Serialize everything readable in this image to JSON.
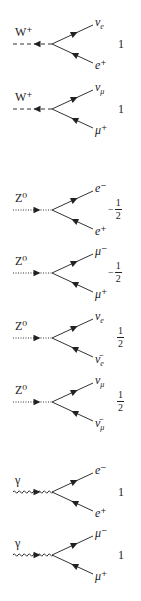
{
  "vertices": [
    {
      "boson": "W⁺",
      "style": "dashed",
      "arrow": "in",
      "top": "ν",
      "top_sub": "e",
      "bottom": "e⁺",
      "bottom_sub": "",
      "coupling": "1",
      "y": 44
    },
    {
      "boson": "W⁺",
      "style": "dashed",
      "arrow": "in",
      "top": "ν",
      "top_sub": "μ",
      "bottom": "μ⁺",
      "bottom_sub": "",
      "coupling": "1",
      "y": 109
    },
    {
      "boson": "Z⁰",
      "style": "dotted",
      "arrow": "out",
      "top": "e⁻",
      "top_sub": "",
      "bottom": "e⁺",
      "bottom_sub": "",
      "coupling_sign": "−",
      "coupling_num": "1",
      "coupling_den": "2",
      "y": 210
    },
    {
      "boson": "Z⁰",
      "style": "dotted",
      "arrow": "out",
      "top": "μ⁻",
      "top_sub": "",
      "bottom": "μ⁺",
      "bottom_sub": "",
      "coupling_sign": "−",
      "coupling_num": "1",
      "coupling_den": "2",
      "y": 273
    },
    {
      "boson": "Z⁰",
      "style": "dotted",
      "arrow": "out",
      "top": "ν",
      "top_sub": "e",
      "bottom": "ν̄",
      "bottom_sub": "e",
      "coupling_sign": "",
      "coupling_num": "1",
      "coupling_den": "2",
      "y": 338
    },
    {
      "boson": "Z⁰",
      "style": "dotted",
      "arrow": "out",
      "top": "ν",
      "top_sub": "μ",
      "bottom": "ν̄",
      "bottom_sub": "μ",
      "coupling_sign": "",
      "coupling_num": "1",
      "coupling_den": "2",
      "y": 402
    },
    {
      "boson": "γ",
      "style": "wavy",
      "arrow": "out",
      "top": "e⁻",
      "top_sub": "",
      "bottom": "e⁺",
      "bottom_sub": "",
      "coupling": "1",
      "y": 492
    },
    {
      "boson": "γ",
      "style": "wavy",
      "arrow": "out",
      "top": "μ⁻",
      "top_sub": "",
      "bottom": "μ⁺",
      "bottom_sub": "",
      "coupling": "1",
      "y": 555
    }
  ]
}
